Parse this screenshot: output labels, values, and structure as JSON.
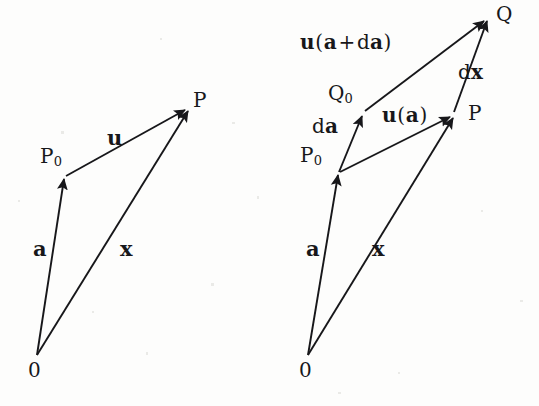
{
  "figure": {
    "background_color": "#fdfdfc",
    "ink_color": "#17171a",
    "panels": [
      {
        "id": "left-panel",
        "name": "displacement-vector-diagram",
        "points": [
          {
            "id": "origin",
            "label": "0",
            "x": 37,
            "y": 355
          },
          {
            "id": "P0",
            "label": "P",
            "sub": "0",
            "x": 64,
            "y": 177
          },
          {
            "id": "P",
            "label": "P",
            "x": 187,
            "y": 108
          }
        ],
        "vectors": [
          {
            "id": "a-left",
            "label": "a",
            "from": "origin",
            "to": "P0",
            "label_x": 33,
            "label_y": 238
          },
          {
            "id": "u-left",
            "label": "u",
            "from": "P0",
            "to": "P",
            "label_x": 107,
            "label_y": 127
          },
          {
            "id": "x-left",
            "label": "x",
            "from": "origin",
            "to": "P",
            "label_x": 120,
            "label_y": 238
          }
        ],
        "point_labels": [
          {
            "id": "label-P0-left",
            "text": "P",
            "sub": "0",
            "x": 40,
            "y": 146
          },
          {
            "id": "label-P-left",
            "text": "P",
            "sub": "",
            "x": 193,
            "y": 90
          },
          {
            "id": "label-O-left",
            "text": "0",
            "sub": "",
            "x": 28,
            "y": 360
          }
        ]
      },
      {
        "id": "right-panel",
        "name": "differential-displacement-diagram",
        "points": [
          {
            "id": "origin2",
            "label": "0",
            "x": 308,
            "y": 355
          },
          {
            "id": "P0r",
            "label": "P",
            "sub": "0",
            "x": 338,
            "y": 173
          },
          {
            "id": "Q0r",
            "label": "Q",
            "sub": "0",
            "x": 363,
            "y": 113
          },
          {
            "id": "Pr",
            "label": "P",
            "x": 452,
            "y": 115
          },
          {
            "id": "Qr",
            "label": "Q",
            "x": 485,
            "y": 18
          }
        ],
        "vectors": [
          {
            "id": "a-right",
            "label": "a",
            "from": "origin2",
            "to": "P0r"
          },
          {
            "id": "x-right",
            "label": "x",
            "from": "origin2",
            "to": "Pr"
          },
          {
            "id": "da-right",
            "label": "da",
            "from": "P0r",
            "to": "Q0r"
          },
          {
            "id": "u-a-right",
            "label": "u(a)",
            "from": "P0r",
            "to": "Pr"
          },
          {
            "id": "u-ada-right",
            "label": "u(a+da)",
            "from": "Q0r",
            "to": "Qr"
          },
          {
            "id": "dx-right",
            "label": "dx",
            "from": "Pr",
            "to": "Qr"
          }
        ],
        "point_labels": [
          {
            "id": "label-Q-right",
            "text": "Q",
            "sub": "",
            "x": 496,
            "y": 4
          },
          {
            "id": "label-Q0-right",
            "text": "Q",
            "sub": "0",
            "x": 328,
            "y": 83
          },
          {
            "id": "label-P0-right",
            "text": "P",
            "sub": "0",
            "x": 300,
            "y": 145
          },
          {
            "id": "label-P-right",
            "text": "P",
            "sub": "",
            "x": 468,
            "y": 103
          },
          {
            "id": "label-O-right",
            "text": "0",
            "sub": "",
            "x": 299,
            "y": 360
          }
        ],
        "vector_labels": [
          {
            "id": "label-u-a-plus-da",
            "x": 300,
            "y": 32,
            "parts": [
              "u",
              "(",
              "a",
              "+",
              "d",
              "a",
              ")"
            ]
          },
          {
            "id": "label-dx",
            "x": 458,
            "y": 62,
            "parts": [
              "d",
              "x"
            ]
          },
          {
            "id": "label-u-a",
            "x": 382,
            "y": 105,
            "parts": [
              "u",
              "(",
              "a",
              ")"
            ]
          },
          {
            "id": "label-da",
            "x": 312,
            "y": 116,
            "parts": [
              "d",
              "a"
            ]
          },
          {
            "id": "label-a-right",
            "x": 306,
            "y": 238,
            "parts": [
              "a"
            ]
          },
          {
            "id": "label-x-right",
            "x": 372,
            "y": 238,
            "parts": [
              "x"
            ]
          }
        ]
      }
    ],
    "symbols": {
      "vector_u": "u",
      "vector_a": "a",
      "vector_x": "x",
      "differential_d": "d",
      "plus": "+",
      "paren_open": "(",
      "paren_close": ")",
      "subscript_zero": "0",
      "point_P": "P",
      "point_Q": "Q",
      "origin": "0"
    }
  }
}
